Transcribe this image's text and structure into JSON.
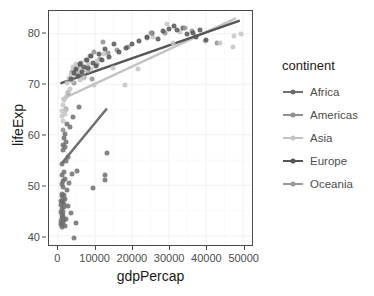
{
  "chart_data": {
    "type": "scatter",
    "title": "",
    "xlabel": "gdpPercap",
    "ylabel": "lifeExp",
    "xlim": [
      -2500,
      52500
    ],
    "ylim": [
      38.2,
      84.5
    ],
    "xticks": [
      0,
      10000,
      20000,
      30000,
      40000,
      50000
    ],
    "xticklabels": [
      "0",
      "10000",
      "20000",
      "30000",
      "40000",
      "50000"
    ],
    "yticks": [
      40,
      50,
      60,
      70,
      80
    ],
    "yticklabels": [
      "40",
      "50",
      "60",
      "70",
      "80"
    ],
    "grid": true,
    "grid_minor": true,
    "legend_title": "continent",
    "legend_position": "right",
    "panel_background": "#ffffff",
    "panel_border": "#4a4a4a",
    "grid_color": "#f2f2f2",
    "smoother": "linear trend line per continent",
    "series": [
      {
        "name": "Africa",
        "color": "#6e6e6e",
        "trendline": {
          "x": [
            1000,
            13200
          ],
          "y": [
            54.4,
            65.2
          ]
        },
        "points": [
          [
            720,
            43.0
          ],
          [
            760,
            47.0
          ],
          [
            820,
            42.4
          ],
          [
            860,
            44.7
          ],
          [
            880,
            46.2
          ],
          [
            900,
            48.3
          ],
          [
            930,
            43.5
          ],
          [
            950,
            50.2
          ],
          [
            970,
            42.1
          ],
          [
            990,
            46.7
          ],
          [
            1010,
            52.0
          ],
          [
            1030,
            44.2
          ],
          [
            1050,
            47.8
          ],
          [
            1080,
            41.8
          ],
          [
            1100,
            54.2
          ],
          [
            1130,
            45.3
          ],
          [
            1160,
            49.6
          ],
          [
            1190,
            43.9
          ],
          [
            1220,
            56.9
          ],
          [
            1250,
            42.6
          ],
          [
            1290,
            47.1
          ],
          [
            1320,
            58.0
          ],
          [
            1360,
            44.8
          ],
          [
            1400,
            50.9
          ],
          [
            1450,
            46.4
          ],
          [
            1490,
            59.4
          ],
          [
            1530,
            43.1
          ],
          [
            1580,
            52.6
          ],
          [
            1620,
            48.0
          ],
          [
            1680,
            45.8
          ],
          [
            1730,
            57.5
          ],
          [
            1790,
            42.0
          ],
          [
            1850,
            60.2
          ],
          [
            1900,
            51.3
          ],
          [
            1970,
            47.4
          ],
          [
            2040,
            54.8
          ],
          [
            2120,
            43.4
          ],
          [
            2200,
            58.6
          ],
          [
            2300,
            49.1
          ],
          [
            2420,
            62.1
          ],
          [
            2560,
            46.0
          ],
          [
            2700,
            55.6
          ],
          [
            2880,
            50.5
          ],
          [
            3100,
            61.5
          ],
          [
            3400,
            44.6
          ],
          [
            3700,
            52.3
          ],
          [
            4000,
            63.6
          ],
          [
            4400,
            39.6
          ],
          [
            4800,
            42.6
          ],
          [
            5200,
            52.9
          ],
          [
            5600,
            65.5
          ],
          [
            9500,
            49.4
          ],
          [
            12600,
            51.0
          ],
          [
            12800,
            52.1
          ],
          [
            13100,
            56.5
          ]
        ]
      },
      {
        "name": "Americas",
        "color": "#8f8f8f",
        "trendline": null,
        "points": [
          [
            1200,
            60.9
          ],
          [
            2000,
            65.2
          ],
          [
            2700,
            68.2
          ],
          [
            3400,
            71.0
          ],
          [
            3700,
            72.4
          ],
          [
            4200,
            70.3
          ],
          [
            4900,
            72.9
          ],
          [
            5300,
            71.6
          ],
          [
            5800,
            73.7
          ],
          [
            6000,
            72.2
          ],
          [
            6300,
            74.2
          ],
          [
            7000,
            71.4
          ],
          [
            7400,
            74.8
          ],
          [
            8100,
            72.6
          ],
          [
            8700,
            75.6
          ],
          [
            9100,
            71.1
          ],
          [
            9800,
            76.3
          ],
          [
            10600,
            74.0
          ],
          [
            11200,
            75.1
          ],
          [
            12000,
            78.3
          ],
          [
            13400,
            76.1
          ],
          [
            16000,
            76.8
          ],
          [
            19000,
            77.3
          ],
          [
            24000,
            79.2
          ],
          [
            29000,
            80.2
          ],
          [
            36300,
            80.6
          ],
          [
            42900,
            78.2
          ]
        ]
      },
      {
        "name": "Asia",
        "color": "#c4c4c4",
        "trendline": {
          "x": [
            900,
            48200
          ],
          "y": [
            67.0,
            83.1
          ]
        },
        "points": [
          [
            950,
            63.8
          ],
          [
            1100,
            64.7
          ],
          [
            1250,
            65.9
          ],
          [
            1400,
            62.7
          ],
          [
            1600,
            66.8
          ],
          [
            1800,
            64.1
          ],
          [
            2000,
            67.5
          ],
          [
            2200,
            65.0
          ],
          [
            2400,
            70.2
          ],
          [
            2700,
            68.4
          ],
          [
            2900,
            71.3
          ],
          [
            3200,
            69.1
          ],
          [
            3500,
            72.0
          ],
          [
            3800,
            70.6
          ],
          [
            4100,
            73.4
          ],
          [
            4500,
            71.8
          ],
          [
            4900,
            74.1
          ],
          [
            5300,
            72.5
          ],
          [
            5800,
            70.9
          ],
          [
            6300,
            73.0
          ],
          [
            6900,
            71.2
          ],
          [
            7500,
            72.8
          ],
          [
            8200,
            74.0
          ],
          [
            8900,
            73.1
          ],
          [
            9700,
            69.8
          ],
          [
            10600,
            74.6
          ],
          [
            12400,
            75.9
          ],
          [
            14800,
            73.2
          ],
          [
            18200,
            69.8
          ],
          [
            21500,
            73.1
          ],
          [
            25700,
            79.3
          ],
          [
            29500,
            81.9
          ],
          [
            31000,
            78.2
          ],
          [
            33000,
            80.4
          ],
          [
            39800,
            78.6
          ],
          [
            43800,
            78.2
          ],
          [
            47300,
            77.3
          ],
          [
            47600,
            79.5
          ],
          [
            49400,
            80.0
          ]
        ]
      },
      {
        "name": "Europe",
        "color": "#555555",
        "trendline": {
          "x": [
            600,
            49200
          ],
          "y": [
            70.2,
            82.6
          ]
        },
        "points": [
          [
            3500,
            71.0
          ],
          [
            4200,
            72.2
          ],
          [
            4800,
            73.0
          ],
          [
            5300,
            71.6
          ],
          [
            5800,
            74.1
          ],
          [
            6400,
            72.5
          ],
          [
            7100,
            73.4
          ],
          [
            7700,
            74.9
          ],
          [
            8200,
            73.2
          ],
          [
            8900,
            75.6
          ],
          [
            9500,
            74.3
          ],
          [
            10200,
            73.6
          ],
          [
            11000,
            76.0
          ],
          [
            11800,
            74.8
          ],
          [
            12700,
            76.9
          ],
          [
            13700,
            75.3
          ],
          [
            15000,
            77.9
          ],
          [
            16500,
            76.4
          ],
          [
            18300,
            77.2
          ],
          [
            20000,
            78.0
          ],
          [
            22000,
            78.5
          ],
          [
            24000,
            79.3
          ],
          [
            25500,
            80.2
          ],
          [
            27000,
            79.0
          ],
          [
            28500,
            80.5
          ],
          [
            30000,
            81.0
          ],
          [
            31300,
            81.6
          ],
          [
            32200,
            80.8
          ],
          [
            33800,
            81.2
          ],
          [
            35000,
            80.0
          ],
          [
            36500,
            80.2
          ],
          [
            37400,
            79.4
          ],
          [
            38500,
            80.8
          ],
          [
            40100,
            78.8
          ]
        ]
      },
      {
        "name": "Oceania",
        "color": "#999999",
        "trendline": null,
        "points": [
          [
            25200,
            80.2
          ],
          [
            34400,
            81.2
          ]
        ]
      }
    ]
  }
}
